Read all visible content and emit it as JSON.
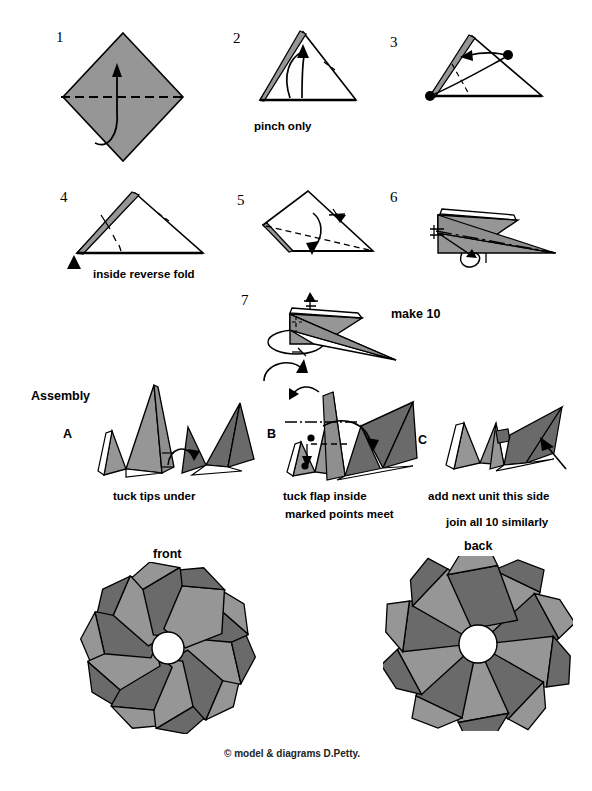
{
  "document": {
    "title": "Modular origami diagram - 10 unit ring",
    "copyright": "©  model & diagrams D.Petty."
  },
  "colors": {
    "paper_light": "#969696",
    "paper_mid": "#8f8f8f",
    "paper_dark": "#6a6a6a",
    "paper_white": "#ffffff",
    "line": "#000000",
    "background": "#ffffff"
  },
  "steps": [
    {
      "id": "step-1",
      "number": "1",
      "caption": ""
    },
    {
      "id": "step-2",
      "number": "2",
      "caption": "pinch only"
    },
    {
      "id": "step-3",
      "number": "3",
      "caption": ""
    },
    {
      "id": "step-4",
      "number": "4",
      "caption": "inside reverse fold"
    },
    {
      "id": "step-5",
      "number": "5",
      "caption": ""
    },
    {
      "id": "step-6",
      "number": "6",
      "caption": ""
    },
    {
      "id": "step-7",
      "number": "7",
      "caption": "make 10"
    }
  ],
  "assembly": {
    "heading": "Assembly",
    "steps": [
      {
        "id": "assembly-a",
        "letter": "A",
        "caption": "tuck tips under"
      },
      {
        "id": "assembly-b",
        "letter": "B",
        "caption_line1": "tuck flap inside",
        "caption_line2": "marked points meet"
      },
      {
        "id": "assembly-c",
        "letter": "C",
        "caption_line1": "add next unit this side",
        "caption_line2": "join all 10 similarly"
      }
    ]
  },
  "results": [
    {
      "id": "result-front",
      "label": "front",
      "units": 10
    },
    {
      "id": "result-back",
      "label": "back",
      "units": 10
    }
  ]
}
